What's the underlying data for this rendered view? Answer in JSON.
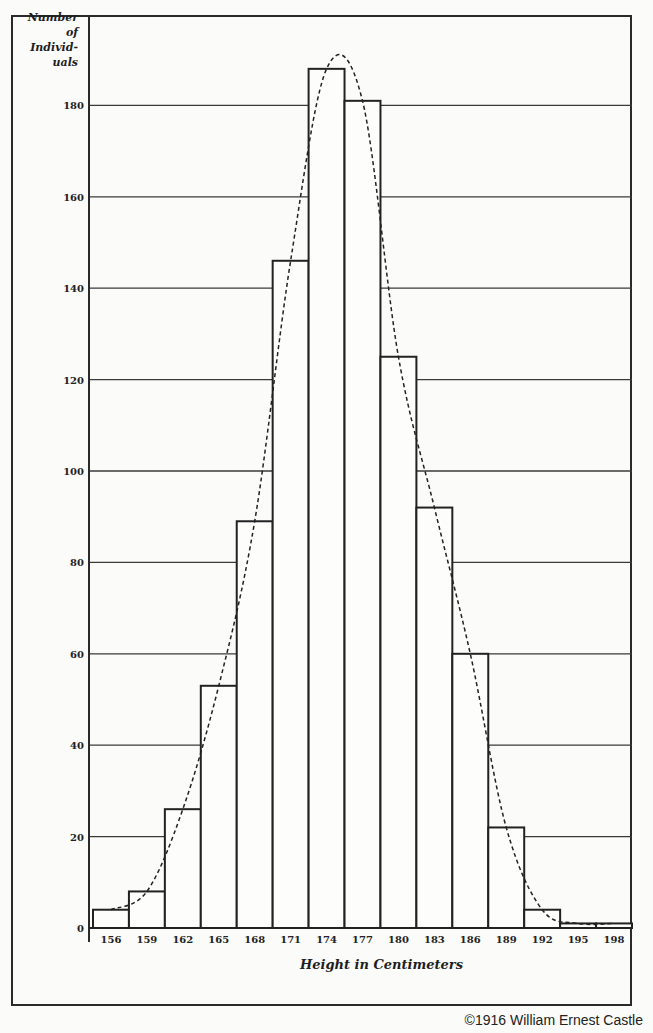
{
  "chart_data": {
    "type": "bar",
    "title": "",
    "xlabel": "Height in Centimeters",
    "ylabel": "Number of Individuals",
    "ylabel_lines": [
      "Number of",
      "Individ-",
      "uals"
    ],
    "categories": [
      "156",
      "159",
      "162",
      "165",
      "168",
      "171",
      "174",
      "177",
      "180",
      "183",
      "186",
      "189",
      "192",
      "195",
      "198"
    ],
    "values": [
      4,
      8,
      26,
      53,
      89,
      146,
      188,
      181,
      125,
      92,
      60,
      22,
      4,
      1,
      1
    ],
    "overlay": {
      "type": "line",
      "style": "dashed",
      "description": "smoothed normal curve"
    },
    "yticks": [
      0,
      20,
      40,
      60,
      80,
      100,
      120,
      140,
      160,
      180
    ],
    "ylim": [
      0,
      200
    ],
    "grid": true,
    "legend": null
  },
  "credit": "©1916 William Ernest Castle"
}
